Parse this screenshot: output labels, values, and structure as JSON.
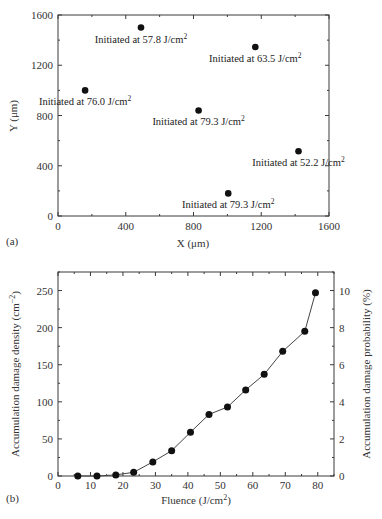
{
  "chart_data": [
    {
      "panel": "(a)",
      "type": "scatter",
      "title": "",
      "xlabel": "X (μm)",
      "ylabel": "Y (μm)",
      "xlim": [
        0,
        1600
      ],
      "ylim": [
        0,
        1600
      ],
      "xticks": [
        0,
        400,
        800,
        1200,
        1600
      ],
      "yticks": [
        0,
        400,
        800,
        1200,
        1600
      ],
      "grid": false,
      "points": [
        {
          "x": 490,
          "y": 1500,
          "label": "Initiated at 57.8 J/cm",
          "sup": "2"
        },
        {
          "x": 1165,
          "y": 1345,
          "label": "Initiated at 63.5 J/cm",
          "sup": "2"
        },
        {
          "x": 160,
          "y": 1000,
          "label": "Initiated at 76.0 J/cm",
          "sup": "2"
        },
        {
          "x": 830,
          "y": 840,
          "label": "Initiated at 79.3 J/cm",
          "sup": "2"
        },
        {
          "x": 1420,
          "y": 515,
          "label": "Initiated at 52.2 J/cm",
          "sup": "2"
        },
        {
          "x": 1005,
          "y": 180,
          "label": "Initiated at 79.3 J/cm",
          "sup": "2"
        }
      ]
    },
    {
      "panel": "(b)",
      "type": "line",
      "title": "",
      "xlabel": "Fluence (J/cm",
      "xlabel_sup": "2",
      "xlabel_end": ")",
      "ylabel": "Accumulation damage density (cm",
      "ylabel_sup": "−2",
      "ylabel_end": ")",
      "y2label": "Accumulation damage probability (%)",
      "xlim": [
        0,
        85
      ],
      "ylim": [
        0,
        275
      ],
      "y2lim": [
        0,
        11
      ],
      "xticks": [
        0,
        10,
        20,
        30,
        40,
        50,
        60,
        70,
        80
      ],
      "yticks": [
        0,
        50,
        100,
        150,
        200,
        250
      ],
      "y2ticks": [
        0,
        2,
        4,
        6,
        8,
        10
      ],
      "grid": false,
      "x": [
        6.1,
        12.0,
        17.8,
        23.3,
        29.2,
        35.0,
        40.8,
        46.5,
        52.2,
        57.8,
        63.5,
        69.2,
        76.0,
        79.3
      ],
      "series": [
        {
          "name": "Accumulation damage density",
          "values": [
            0,
            0,
            1.5,
            5,
            19,
            34,
            59,
            83,
            93,
            116,
            137,
            168,
            195,
            247
          ]
        }
      ]
    }
  ],
  "labels": {
    "panel_a": "(a)",
    "panel_b": "(b)"
  }
}
